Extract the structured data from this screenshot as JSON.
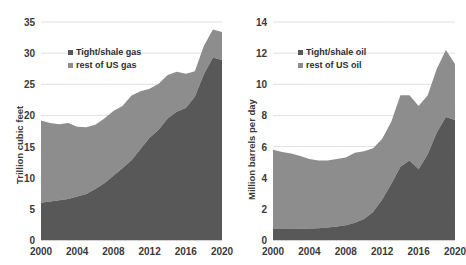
{
  "chart_data": [
    {
      "type": "area",
      "stacked": true,
      "panel": "left",
      "title": "",
      "xlabel": "",
      "ylabel": "Trillion cubic feet",
      "xlim": [
        2000,
        2020
      ],
      "ylim": [
        0,
        35
      ],
      "yticks": [
        0,
        5,
        10,
        15,
        20,
        25,
        30,
        35
      ],
      "xticks": [
        2000,
        2004,
        2008,
        2012,
        2016,
        2020
      ],
      "grid": "horizontal",
      "legend_position": "upper-left-inside",
      "x": [
        2000,
        2001,
        2002,
        2003,
        2004,
        2005,
        2006,
        2007,
        2008,
        2009,
        2010,
        2011,
        2012,
        2013,
        2014,
        2015,
        2016,
        2017,
        2018,
        2019,
        2020
      ],
      "series": [
        {
          "name": "Tight/shale gas",
          "color": "#585858",
          "values": [
            6.0,
            6.2,
            6.4,
            6.6,
            7.0,
            7.4,
            8.2,
            9.1,
            10.3,
            11.5,
            12.8,
            14.6,
            16.4,
            17.7,
            19.5,
            20.6,
            21.2,
            23.0,
            26.6,
            29.3,
            28.9
          ]
        },
        {
          "name": "rest of US gas",
          "color": "#8d8d8d",
          "values": [
            13.2,
            12.6,
            12.2,
            12.2,
            11.2,
            10.7,
            10.3,
            10.4,
            10.4,
            10.0,
            10.4,
            9.3,
            7.9,
            7.4,
            7.0,
            6.4,
            5.5,
            4.1,
            4.6,
            4.5,
            4.5
          ]
        }
      ],
      "totals": [
        19.2,
        18.8,
        18.6,
        18.8,
        18.2,
        18.1,
        18.5,
        19.5,
        20.7,
        21.5,
        23.2,
        23.9,
        24.3,
        25.1,
        26.5,
        27.0,
        26.7,
        27.1,
        31.2,
        33.8,
        33.4
      ]
    },
    {
      "type": "area",
      "stacked": true,
      "panel": "right",
      "title": "",
      "xlabel": "",
      "ylabel": "Million barrels per day",
      "xlim": [
        2000,
        2020
      ],
      "ylim": [
        0,
        14
      ],
      "yticks": [
        0,
        2,
        4,
        6,
        8,
        10,
        12,
        14
      ],
      "xticks": [
        2000,
        2004,
        2008,
        2012,
        2016,
        2020
      ],
      "grid": "horizontal",
      "legend_position": "upper-left-inside",
      "x": [
        2000,
        2001,
        2002,
        2003,
        2004,
        2005,
        2006,
        2007,
        2008,
        2009,
        2010,
        2011,
        2012,
        2013,
        2014,
        2015,
        2016,
        2017,
        2018,
        2019,
        2020
      ],
      "series": [
        {
          "name": "Tight/shale oil",
          "color": "#585858",
          "values": [
            0.7,
            0.7,
            0.7,
            0.72,
            0.74,
            0.76,
            0.8,
            0.86,
            0.95,
            1.1,
            1.35,
            1.8,
            2.6,
            3.6,
            4.7,
            5.1,
            4.55,
            5.5,
            6.9,
            7.9,
            7.7
          ]
        },
        {
          "name": "rest of US oil",
          "color": "#8d8d8d",
          "values": [
            5.1,
            4.95,
            4.85,
            4.68,
            4.46,
            4.34,
            4.3,
            4.34,
            4.35,
            4.5,
            4.35,
            4.1,
            3.9,
            4.0,
            4.6,
            4.2,
            4.05,
            3.8,
            4.1,
            4.3,
            3.6
          ]
        }
      ],
      "totals": [
        5.8,
        5.65,
        5.55,
        5.4,
        5.2,
        5.1,
        5.1,
        5.2,
        5.3,
        5.6,
        5.7,
        5.9,
        6.5,
        7.6,
        9.3,
        9.3,
        8.6,
        9.3,
        11.0,
        12.2,
        11.3
      ]
    }
  ],
  "left": {
    "ylabel": "Trillion cubic feet",
    "yticks": [
      "0",
      "5",
      "10",
      "15",
      "20",
      "25",
      "30",
      "35"
    ],
    "xticks": [
      "2000",
      "2004",
      "2008",
      "2012",
      "2016",
      "2020"
    ],
    "legend": [
      {
        "label": "Tight/shale gas",
        "color": "#585858"
      },
      {
        "label": "rest of US gas",
        "color": "#8d8d8d"
      }
    ]
  },
  "right": {
    "ylabel": "Million barrels per day",
    "yticks": [
      "0",
      "2",
      "4",
      "6",
      "8",
      "10",
      "12",
      "14"
    ],
    "xticks": [
      "2000",
      "2004",
      "2008",
      "2012",
      "2016",
      "2020"
    ],
    "legend": [
      {
        "label": "Tight/shale oil",
        "color": "#585858"
      },
      {
        "label": "rest of US oil",
        "color": "#8d8d8d"
      }
    ]
  }
}
